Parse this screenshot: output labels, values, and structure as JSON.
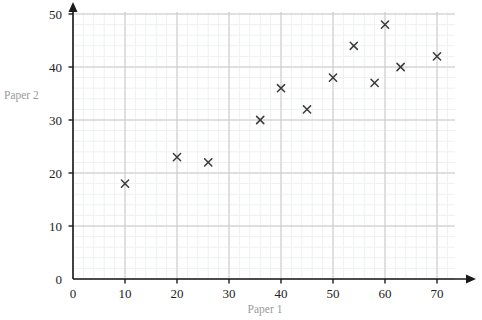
{
  "chart_data": {
    "type": "scatter",
    "title": "",
    "xlabel": "Paper 1",
    "ylabel": "Paper 2",
    "xlim": [
      0,
      73
    ],
    "ylim": [
      0,
      51
    ],
    "xticks": [
      0,
      10,
      20,
      30,
      40,
      50,
      60,
      70
    ],
    "yticks": [
      0,
      10,
      20,
      30,
      40,
      50
    ],
    "xtick_labels": [
      "0",
      "10",
      "20",
      "30",
      "40",
      "50",
      "60",
      "70"
    ],
    "ytick_labels": [
      "0",
      "10",
      "20",
      "30",
      "40",
      "50"
    ],
    "grid": true,
    "grid_major_step": 10,
    "grid_minor_step": 2,
    "legend": false,
    "marker": "x",
    "points": [
      {
        "x": 10,
        "y": 18
      },
      {
        "x": 20,
        "y": 23
      },
      {
        "x": 26,
        "y": 22
      },
      {
        "x": 36,
        "y": 30
      },
      {
        "x": 40,
        "y": 36
      },
      {
        "x": 45,
        "y": 32
      },
      {
        "x": 50,
        "y": 38
      },
      {
        "x": 54,
        "y": 44
      },
      {
        "x": 58,
        "y": 37
      },
      {
        "x": 60,
        "y": 48
      },
      {
        "x": 63,
        "y": 40
      },
      {
        "x": 70,
        "y": 42
      }
    ]
  },
  "colors": {
    "marker": "#3a3a3a",
    "axis": "#1a1a1a",
    "grid_major": "#c8c8c8",
    "grid_minor": "#eef0f2",
    "tick_text": "#222222",
    "axis_title": "#9a9a9a",
    "background": "#ffffff"
  },
  "axis_titles": {
    "x": "Paper 1",
    "y": "Paper 2"
  }
}
